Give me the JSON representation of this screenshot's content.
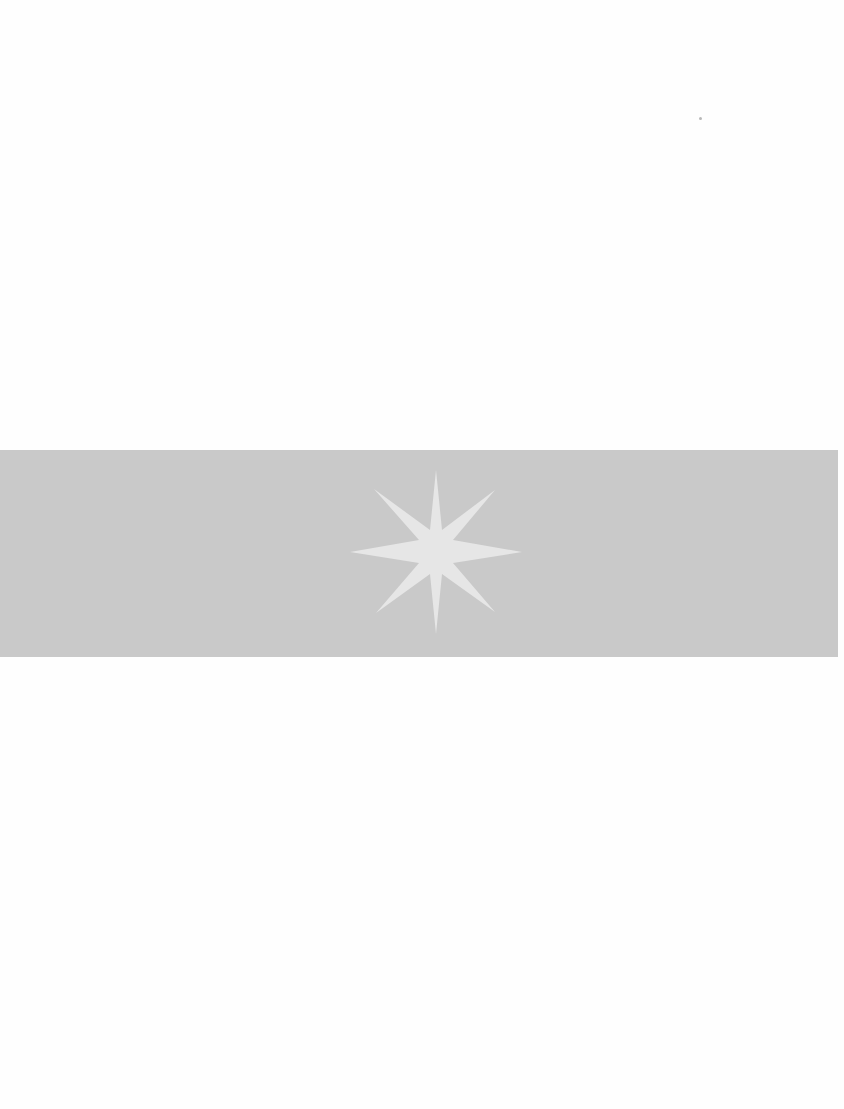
{
  "page": {
    "background_color": "#ffffff",
    "band": {
      "color": "#c9c9c9",
      "top": 450,
      "height": 207
    },
    "ornament": {
      "icon": "eight-point-star-icon",
      "color": "#e6e6e6"
    }
  }
}
